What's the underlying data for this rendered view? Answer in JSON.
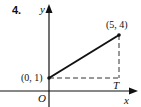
{
  "problem": {
    "number": "4."
  },
  "axes": {
    "x_label": "x",
    "y_label": "y",
    "origin_label": "O"
  },
  "points": [
    {
      "label": "(0, 1)",
      "x": 0,
      "y": 1
    },
    {
      "label": "(5, 4)",
      "x": 5,
      "y": 4
    }
  ],
  "foot_label": "T",
  "colors": {
    "ink": "#111111",
    "background": "#ffffff"
  }
}
